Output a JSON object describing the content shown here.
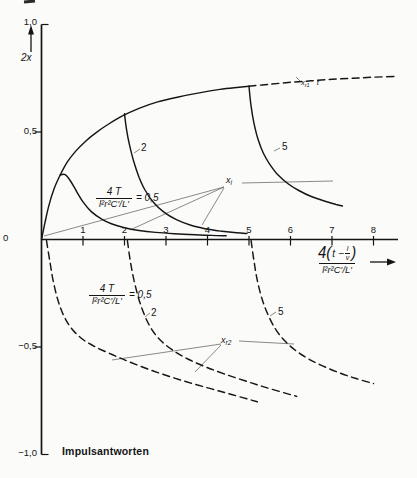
{
  "figure_caption": "Impulsantworten",
  "y_axis": {
    "var_label": "2x",
    "tick_labels": [
      "1,0",
      "0,5",
      "0",
      "−0,5",
      "−1,0"
    ]
  },
  "x_axis": {
    "tick_labels": [
      "1",
      "2",
      "3",
      "4",
      "5",
      "6",
      "7",
      "8"
    ],
    "title": {
      "prefix": "4(",
      "inner_lead": "t −",
      "lv_num": "l",
      "lv_den": "v",
      "suffix": ")",
      "den": "l²r²C′/L′"
    }
  },
  "annotations": {
    "upper_eq": {
      "num": "4 T",
      "den": "l²r²C′/L′",
      "rhs": "= 0,5"
    },
    "lower_eq": {
      "num": "4 T",
      "den": "l²r²C′/L′",
      "rhs": "= 0,5"
    },
    "labels": {
      "upper_2": "2",
      "upper_5": "5",
      "lower_2": "2",
      "lower_5": "5"
    },
    "xi": {
      "base": "x",
      "sub": "i"
    },
    "xr1": {
      "base": "x",
      "sub": "r1",
      "suffix": "t"
    },
    "xr2": {
      "base": "x",
      "sub": "r2"
    }
  },
  "chart_data": {
    "type": "line",
    "title": "Impulsantworten",
    "xlabel": "4(t − l/v) / (l²r²C′/L′)",
    "ylabel": "2x",
    "xlim": [
      0,
      8.6
    ],
    "ylim": [
      -1.0,
      1.0
    ],
    "x_ticks": [
      1,
      2,
      3,
      4,
      5,
      6,
      7,
      8
    ],
    "y_ticks": [
      1.0,
      0.5,
      0,
      -0.5,
      -1.0
    ],
    "grid": false,
    "legend_position": "none",
    "plot": {
      "x0": 41.5,
      "y0": 239.5,
      "xscale": 41.5,
      "yscale": 215,
      "x_axis_end": 398,
      "y_axis_top": 24.5,
      "y_axis_bottom": 454.5
    },
    "series": [
      {
        "name": "rise-envelope",
        "param": null,
        "dash": false,
        "points": [
          [
            0,
            0
          ],
          [
            0.08,
            0.075
          ],
          [
            0.18,
            0.16
          ],
          [
            0.3,
            0.235
          ],
          [
            0.45,
            0.3
          ],
          [
            0.62,
            0.36
          ],
          [
            0.82,
            0.41
          ],
          [
            1.05,
            0.455
          ],
          [
            1.3,
            0.495
          ],
          [
            1.6,
            0.535
          ],
          [
            1.95,
            0.575
          ],
          [
            2.35,
            0.61
          ],
          [
            2.8,
            0.64
          ],
          [
            3.3,
            0.663
          ],
          [
            3.8,
            0.682
          ],
          [
            4.3,
            0.698
          ],
          [
            4.7,
            0.707
          ],
          [
            5.0,
            0.713
          ]
        ]
      },
      {
        "name": "rise-envelope-continuation-xr1",
        "param": null,
        "dash": true,
        "points": [
          [
            5.0,
            0.713
          ],
          [
            5.5,
            0.722
          ],
          [
            6.0,
            0.731
          ],
          [
            6.5,
            0.738
          ],
          [
            7.0,
            0.745
          ],
          [
            7.5,
            0.75
          ],
          [
            8.0,
            0.755
          ],
          [
            8.55,
            0.759
          ]
        ]
      },
      {
        "name": "xi-T0.5",
        "param": 0.5,
        "dash": false,
        "points": [
          [
            0.45,
            0.3
          ],
          [
            0.57,
            0.302
          ],
          [
            0.7,
            0.272
          ],
          [
            0.85,
            0.222
          ],
          [
            1.0,
            0.175
          ],
          [
            1.2,
            0.13
          ],
          [
            1.45,
            0.095
          ],
          [
            1.7,
            0.072
          ],
          [
            2.0,
            0.055
          ],
          [
            2.35,
            0.042
          ],
          [
            2.75,
            0.033
          ],
          [
            3.2,
            0.027
          ],
          [
            3.7,
            0.022
          ],
          [
            4.1,
            0.019
          ],
          [
            4.45,
            0.017
          ]
        ]
      },
      {
        "name": "xi-T2",
        "param": 2,
        "dash": false,
        "points": [
          [
            2.0,
            0.585
          ],
          [
            2.05,
            0.51
          ],
          [
            2.12,
            0.44
          ],
          [
            2.22,
            0.365
          ],
          [
            2.35,
            0.29
          ],
          [
            2.5,
            0.228
          ],
          [
            2.7,
            0.172
          ],
          [
            2.95,
            0.127
          ],
          [
            3.25,
            0.092
          ],
          [
            3.6,
            0.066
          ],
          [
            3.95,
            0.05
          ],
          [
            4.35,
            0.038
          ],
          [
            4.7,
            0.031
          ],
          [
            4.95,
            0.028
          ]
        ]
      },
      {
        "name": "xi-T5",
        "param": 5,
        "dash": false,
        "points": [
          [
            5.0,
            0.713
          ],
          [
            5.05,
            0.62
          ],
          [
            5.12,
            0.54
          ],
          [
            5.22,
            0.465
          ],
          [
            5.35,
            0.4
          ],
          [
            5.5,
            0.35
          ],
          [
            5.7,
            0.3
          ],
          [
            5.95,
            0.258
          ],
          [
            6.2,
            0.228
          ],
          [
            6.5,
            0.2
          ],
          [
            6.8,
            0.18
          ],
          [
            7.1,
            0.163
          ],
          [
            7.25,
            0.156
          ]
        ]
      },
      {
        "name": "xr2-T0.5",
        "param": 0.5,
        "dash": true,
        "points": [
          [
            0.12,
            -0.005
          ],
          [
            0.2,
            -0.1
          ],
          [
            0.28,
            -0.19
          ],
          [
            0.4,
            -0.285
          ],
          [
            0.55,
            -0.36
          ],
          [
            0.75,
            -0.42
          ],
          [
            1.0,
            -0.465
          ],
          [
            1.3,
            -0.5
          ],
          [
            1.7,
            -0.535
          ],
          [
            2.1,
            -0.568
          ],
          [
            2.6,
            -0.605
          ],
          [
            3.1,
            -0.638
          ],
          [
            3.6,
            -0.668
          ],
          [
            4.1,
            -0.695
          ],
          [
            4.6,
            -0.722
          ],
          [
            5.2,
            -0.755
          ]
        ]
      },
      {
        "name": "xr2-T2",
        "param": 2,
        "dash": true,
        "points": [
          [
            2.07,
            -0.005
          ],
          [
            2.14,
            -0.1
          ],
          [
            2.23,
            -0.19
          ],
          [
            2.35,
            -0.28
          ],
          [
            2.5,
            -0.36
          ],
          [
            2.68,
            -0.425
          ],
          [
            2.9,
            -0.475
          ],
          [
            3.2,
            -0.52
          ],
          [
            3.55,
            -0.558
          ],
          [
            3.95,
            -0.592
          ],
          [
            4.4,
            -0.625
          ],
          [
            4.9,
            -0.657
          ],
          [
            5.4,
            -0.688
          ],
          [
            6.15,
            -0.73
          ]
        ]
      },
      {
        "name": "xr2-T5",
        "param": 5,
        "dash": true,
        "points": [
          [
            5.05,
            -0.005
          ],
          [
            5.12,
            -0.1
          ],
          [
            5.2,
            -0.19
          ],
          [
            5.32,
            -0.28
          ],
          [
            5.47,
            -0.355
          ],
          [
            5.65,
            -0.42
          ],
          [
            5.88,
            -0.475
          ],
          [
            6.15,
            -0.52
          ],
          [
            6.45,
            -0.557
          ],
          [
            6.8,
            -0.59
          ],
          [
            7.2,
            -0.622
          ],
          [
            7.6,
            -0.648
          ],
          [
            8.0,
            -0.67
          ]
        ]
      }
    ],
    "pointer_lines": [
      [
        224,
        187,
        44,
        236
      ],
      [
        224,
        187,
        130,
        230
      ],
      [
        224,
        188,
        202,
        225
      ],
      [
        242,
        183,
        333,
        181
      ],
      [
        221,
        344,
        112,
        360
      ],
      [
        221,
        345,
        195,
        372
      ],
      [
        239,
        341,
        294,
        344
      ],
      [
        134,
        153,
        140,
        149
      ],
      [
        274,
        151,
        280,
        148
      ],
      [
        145,
        317,
        150,
        313
      ],
      [
        270,
        316,
        276,
        312
      ],
      [
        296,
        77,
        301,
        82
      ]
    ],
    "arrows": [
      {
        "name": "y-axis-arrow-icon",
        "shaft": [
          31,
          52,
          31,
          31
        ],
        "head": "31,25 28,34.5 34,34.5"
      },
      {
        "name": "x-axis-arrow-icon",
        "shaft": [
          370,
          262,
          388,
          262
        ],
        "head": "396,262 387,258.5 387,265.5"
      }
    ]
  }
}
